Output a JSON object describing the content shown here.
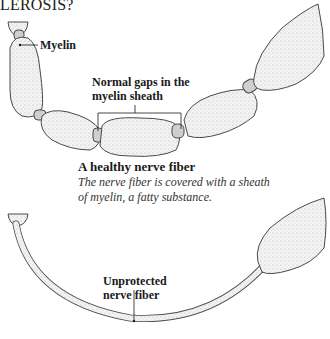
{
  "title": "LEROSIS?",
  "healthy": {
    "labels": {
      "myelin": "Myelin",
      "gaps_line1": "Normal gaps in the",
      "gaps_line2": "myelin sheath"
    },
    "caption": {
      "heading": "A healthy nerve fiber",
      "line1": "The nerve fiber is covered with a sheath",
      "line2": "of myelin, a fatty substance."
    }
  },
  "damaged": {
    "labels": {
      "line1": "Unprotected",
      "line2": "nerve fiber"
    }
  },
  "colors": {
    "fill": "#f1f1f1",
    "stroke": "#4a4a4a",
    "node": "#cfcfcf",
    "text": "#1a1a1a"
  }
}
